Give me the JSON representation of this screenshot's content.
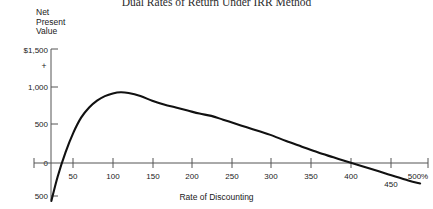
{
  "chart_data": {
    "type": "line",
    "title": "Dual Rates of Return Under IRR Method",
    "xlabel": "Rate of Discounting",
    "ylabel": "Net Present Value",
    "ylabel_lines": [
      "Net",
      "Present",
      "Value"
    ],
    "xlim": [
      0,
      500
    ],
    "ylim": [
      -500,
      1500
    ],
    "grid": false,
    "legend": null,
    "axis_color": "#555555",
    "line_color": "#111111",
    "x_ticks": [
      0,
      50,
      100,
      150,
      200,
      250,
      300,
      350,
      400,
      450,
      500
    ],
    "x_tick_labels": [
      "",
      "50",
      "100",
      "150",
      "200",
      "250",
      "300",
      "350",
      "400",
      "450",
      "500%"
    ],
    "y_ticks": [
      -500,
      0,
      500,
      1000,
      1500
    ],
    "y_tick_labels": [
      "500",
      "0",
      "500",
      "1,000",
      "$1,500"
    ],
    "y_axis_plus_marker": "+",
    "series": [
      {
        "name": "Net Present Value",
        "x": [
          22,
          30,
          40,
          50,
          60,
          70,
          80,
          90,
          100,
          110,
          120,
          135,
          150,
          165,
          180,
          195,
          210,
          225,
          240,
          255,
          270,
          285,
          300,
          320,
          340,
          360,
          380,
          400,
          425,
          450,
          475,
          490
        ],
        "y": [
          -500,
          -180,
          140,
          400,
          600,
          730,
          820,
          880,
          915,
          930,
          920,
          880,
          820,
          770,
          730,
          690,
          650,
          620,
          570,
          520,
          470,
          420,
          370,
          290,
          215,
          140,
          75,
          10,
          -70,
          -150,
          -230,
          -270
        ]
      }
    ],
    "zero_crossings": [
      22,
      403
    ],
    "peak": {
      "x": 110,
      "y": 930
    }
  },
  "labels": {
    "x_axis_title": "Rate of Discounting",
    "y_axis_line1": "Net",
    "y_axis_line2": "Present",
    "y_axis_line3": "Value",
    "plus": "+",
    "y_1500": "$1,500",
    "y_1000": "1,000",
    "y_500": "500",
    "y_0": "0",
    "y_neg500": "500",
    "x_50": "50",
    "x_100": "100",
    "x_150": "150",
    "x_200": "200",
    "x_250": "250",
    "x_300": "300",
    "x_350": "350",
    "x_400": "400",
    "x_450": "450",
    "x_500": "500%"
  }
}
